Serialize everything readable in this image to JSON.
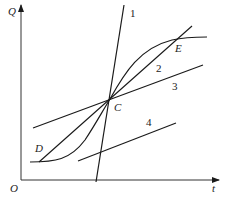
{
  "diagram": {
    "axes": {
      "y_label": "Q",
      "x_label": "t",
      "origin_label": "O"
    },
    "points": {
      "C": "C",
      "D": "D",
      "E": "E"
    },
    "lines": [
      {
        "id": "1",
        "label": "1"
      },
      {
        "id": "2",
        "label": "2"
      },
      {
        "id": "3",
        "label": "3"
      },
      {
        "id": "4",
        "label": "4"
      }
    ],
    "colors": {
      "stroke": "#1a1a1a",
      "background": "#ffffff"
    }
  }
}
